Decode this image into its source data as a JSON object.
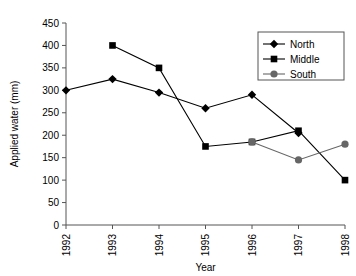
{
  "chart_data": {
    "type": "line",
    "title": "",
    "xlabel": "Year",
    "ylabel": "Applied water (mm)",
    "categories": [
      "1992",
      "1993",
      "1994",
      "1995",
      "1996",
      "1997",
      "1998"
    ],
    "ylim": [
      0,
      450
    ],
    "ytick_step": 50,
    "yticks": [
      "0",
      "50",
      "100",
      "150",
      "200",
      "250",
      "300",
      "350",
      "400",
      "450"
    ],
    "grid": false,
    "legend_position": "top-right",
    "series": [
      {
        "name": "North",
        "marker": "diamond",
        "color": "#000000",
        "values": [
          300,
          325,
          295,
          260,
          290,
          205,
          null
        ]
      },
      {
        "name": "Middle",
        "marker": "square",
        "color": "#000000",
        "values": [
          null,
          400,
          350,
          175,
          185,
          210,
          100
        ]
      },
      {
        "name": "South",
        "marker": "circle",
        "color": "#666666",
        "values": [
          null,
          null,
          null,
          null,
          185,
          145,
          180
        ]
      }
    ]
  },
  "axes": {
    "x_title": "Year",
    "y_title": "Applied water (mm)"
  },
  "legend": {
    "entries": [
      {
        "label": "North",
        "marker": "diamond-marker",
        "color": "#000000"
      },
      {
        "label": "Middle",
        "marker": "square-marker",
        "color": "#000000"
      },
      {
        "label": "South",
        "marker": "circle-marker",
        "color": "#666666"
      }
    ]
  }
}
